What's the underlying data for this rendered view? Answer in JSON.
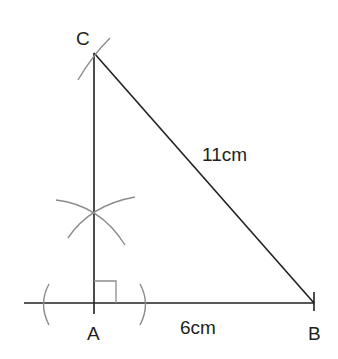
{
  "diagram": {
    "type": "geometric-construction",
    "vertices": {
      "A": {
        "label": "A",
        "x": 94,
        "y": 303
      },
      "B": {
        "label": "B",
        "x": 314,
        "y": 303
      },
      "C": {
        "label": "C",
        "x": 94,
        "y": 53
      }
    },
    "sides": {
      "AB": {
        "label": "6cm"
      },
      "BC": {
        "label": "11cm"
      }
    },
    "right_angle_at": "A",
    "colors": {
      "line": "#231f20",
      "construction_arc": "#8c8c8c",
      "text": "#231f20",
      "background": "#ffffff"
    }
  }
}
